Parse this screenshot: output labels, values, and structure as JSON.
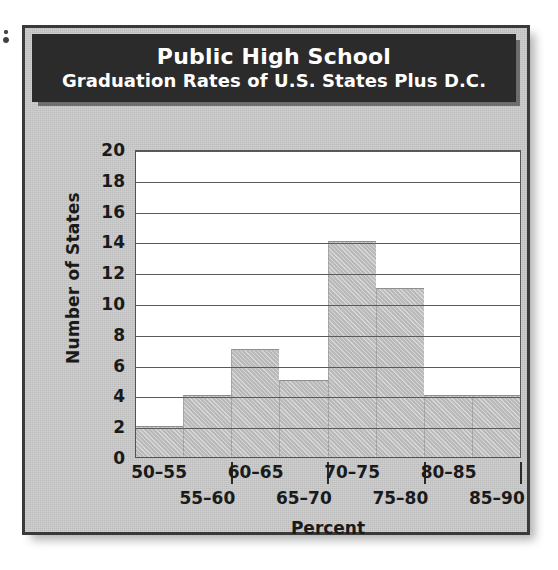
{
  "figure": {
    "title_line1": "Public High School",
    "title_line2": "Graduation Rates of U.S. States Plus D.C."
  },
  "chart_data": {
    "type": "bar",
    "title": "Public High School Graduation Rates of U.S. States Plus D.C.",
    "subtitle": "Graduation Rates of U.S. States Plus D.C.",
    "xlabel": "Percent",
    "ylabel": "Number of States",
    "categories": [
      "50–55",
      "55–60",
      "60–65",
      "65–70",
      "70–75",
      "75–80",
      "80–85",
      "85–90"
    ],
    "values": [
      2,
      4,
      7,
      5,
      14,
      11,
      4,
      4
    ],
    "ylim": [
      0,
      20
    ],
    "ytick_step": 2,
    "yticks": [
      20,
      18,
      16,
      14,
      12,
      10,
      8,
      6,
      4,
      2,
      0
    ],
    "grid": "horizontal",
    "legend": "none",
    "bar_gap": 0,
    "colors": {
      "bar_fill": "#c4c4c4",
      "bar_edge": "#8e8e8e",
      "panel_bg": "#c6c6c6",
      "plot_bg": "#ffffff",
      "gridline": "#5a5a5a",
      "banner_bg": "#2b2b2b",
      "banner_text": "#ffffff",
      "axis_text": "#1a1a1a",
      "frame_border": "#3a3a3a"
    }
  },
  "x_labels_row1": [
    "50–55",
    "60–65",
    "70–75",
    "80–85"
  ],
  "x_labels_row2": [
    "55–60",
    "65–70",
    "75–80",
    "85–90"
  ]
}
